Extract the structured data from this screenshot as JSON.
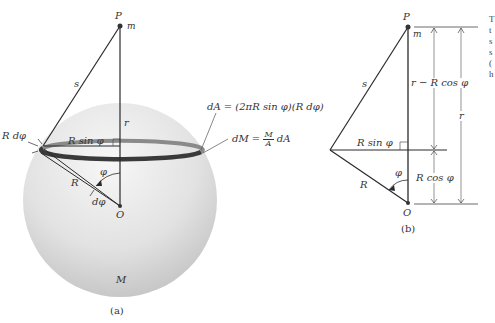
{
  "figure_a": {
    "caption": "(a)",
    "point_P": "P",
    "mass_m": "m",
    "line_s": "s",
    "line_r": "r",
    "ring_radius": "R sin φ",
    "ring_width": "R dφ",
    "radius_R": "R",
    "angle_phi": "φ",
    "angle_dphi": "dφ",
    "center_O": "O",
    "sphere_mass": "M",
    "dA_formula": "dA = (2πR sin φ)(R dφ)",
    "dM_prefix": "dM =",
    "dM_num": "M",
    "dM_den": "A",
    "dM_suffix": "dA"
  },
  "figure_b": {
    "caption": "(b)",
    "point_P": "P",
    "mass_m": "m",
    "line_s": "s",
    "horizontal": "R sin φ",
    "upper_dim": "r − R cos φ",
    "lower_dim": "R cos φ",
    "total_dim": "r",
    "radius_R": "R",
    "angle_phi": "φ",
    "center_O": "O"
  },
  "colors": {
    "line": "#2a2a2a",
    "sphere_light": "#f2f2f2",
    "sphere_dark": "#c4c4c4",
    "ring_dark": "#3a3a3a",
    "ring_light": "#8a8a8a"
  },
  "edge_text_fragments": [
    "T",
    "t",
    "s",
    "s",
    "(",
    "h"
  ]
}
